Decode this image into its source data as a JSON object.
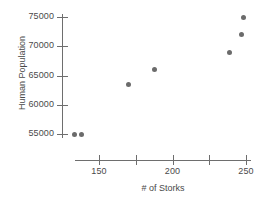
{
  "chart_data": {
    "type": "scatter",
    "title": "",
    "xlabel": "# of Storks",
    "ylabel": "Human Population",
    "xlim": [
      128,
      256
    ],
    "ylim": [
      53500,
      76200
    ],
    "grid": false,
    "legend": null,
    "x_ticks": [
      150,
      175,
      200,
      225,
      250
    ],
    "x_tick_labels": [
      "150",
      "",
      "200",
      "",
      "250"
    ],
    "y_ticks": [
      55000,
      60000,
      65000,
      70000,
      75000
    ],
    "y_tick_labels": [
      "55000",
      "60000",
      "65000",
      "70000",
      "75000"
    ],
    "series": [
      {
        "name": "Storks vs Human Population",
        "marker": "filled-circle",
        "color": "#6b6b6b",
        "points": [
          {
            "x": 133,
            "y": 55000
          },
          {
            "x": 138,
            "y": 55000
          },
          {
            "x": 170,
            "y": 63400
          },
          {
            "x": 188,
            "y": 66000
          },
          {
            "x": 239,
            "y": 69000
          },
          {
            "x": 247,
            "y": 72000
          },
          {
            "x": 248,
            "y": 75000
          }
        ]
      }
    ]
  },
  "style": {
    "axis_color": "#6e6e6e",
    "text_color": "#4a4a4a",
    "marker_color": "#6b6b6b",
    "background": "#ffffff"
  }
}
